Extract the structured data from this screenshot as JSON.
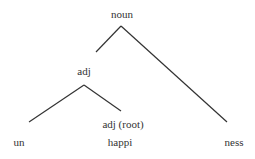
{
  "diagram": {
    "type": "morphology-tree",
    "line_color": "#333333",
    "nodes": [
      {
        "id": "noun",
        "label": "noun",
        "x": 122,
        "y": 14
      },
      {
        "id": "adj",
        "label": "adj",
        "x": 84,
        "y": 71
      },
      {
        "id": "adj-root",
        "label": "adj (root)",
        "x": 123,
        "y": 124
      },
      {
        "id": "un",
        "label": "un",
        "x": 19,
        "y": 142
      },
      {
        "id": "happi",
        "label": "happi",
        "x": 120,
        "y": 142
      },
      {
        "id": "ness",
        "label": "ness",
        "x": 234,
        "y": 142
      }
    ],
    "edges": [
      {
        "from": "noun",
        "to": "adj",
        "x1": 121,
        "y1": 26,
        "x2": 96,
        "y2": 52
      },
      {
        "from": "noun",
        "to": "ness",
        "x1": 121,
        "y1": 26,
        "x2": 227,
        "y2": 122
      },
      {
        "from": "adj",
        "to": "un",
        "x1": 84,
        "y1": 85,
        "x2": 29,
        "y2": 122
      },
      {
        "from": "adj",
        "to": "adj-root",
        "x1": 84,
        "y1": 85,
        "x2": 121,
        "y2": 111
      }
    ]
  }
}
